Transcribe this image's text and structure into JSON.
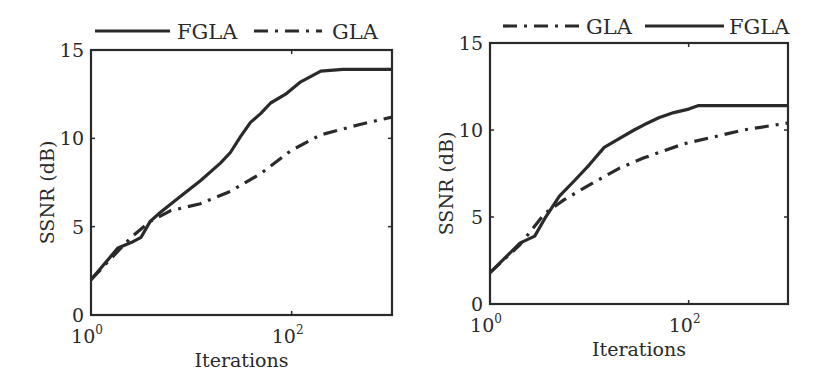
{
  "chart_data": [
    {
      "type": "line",
      "title": "",
      "xlabel": "Iterations",
      "ylabel": "SSNR (dB)",
      "xscale": "log",
      "xlim": [
        1,
        1000
      ],
      "ylim": [
        0,
        15
      ],
      "xticks": [
        {
          "base": "10",
          "exp": "0",
          "value": 1
        },
        {
          "base": "10",
          "exp": "2",
          "value": 100
        }
      ],
      "yticks": [
        0,
        5,
        10,
        15
      ],
      "grid": false,
      "legend_position": "top, outside, horizontal",
      "legend": [
        "FGLA",
        "GLA"
      ],
      "series": [
        {
          "name": "FGLA",
          "style": "solid",
          "x": [
            1,
            1.86,
            2.51,
            3.16,
            3.89,
            4.9,
            7.76,
            12.3,
            19.5,
            24.5,
            30.9,
            38.9,
            49,
            61.7,
            87,
            123,
            195,
            324,
            1000
          ],
          "y": [
            2.0,
            3.8,
            4.1,
            4.4,
            5.3,
            5.8,
            6.7,
            7.6,
            8.6,
            9.2,
            10.1,
            10.9,
            11.4,
            12.0,
            12.5,
            13.2,
            13.8,
            13.9,
            13.9
          ]
        },
        {
          "name": "GLA",
          "style": "dashdot",
          "x": [
            1,
            2.51,
            3.89,
            6.17,
            12.3,
            24.5,
            49,
            98,
            195,
            490,
            1000
          ],
          "y": [
            2.0,
            4.4,
            5.3,
            5.9,
            6.3,
            7.0,
            8.0,
            9.3,
            10.2,
            10.8,
            11.2
          ]
        }
      ]
    },
    {
      "type": "line",
      "title": "",
      "xlabel": "Iterations",
      "ylabel": "SSNR (dB)",
      "xscale": "log",
      "xlim": [
        1,
        1000
      ],
      "ylim": [
        0,
        15
      ],
      "xticks": [
        {
          "base": "10",
          "exp": "0",
          "value": 1
        },
        {
          "base": "10",
          "exp": "2",
          "value": 100
        }
      ],
      "yticks": [
        0,
        5,
        10,
        15
      ],
      "grid": false,
      "legend_position": "top, outside, horizontal",
      "legend": [
        "GLA",
        "FGLA"
      ],
      "series": [
        {
          "name": "GLA",
          "style": "dashdot",
          "x": [
            1,
            2,
            3.55,
            5.6,
            11.2,
            20,
            35.5,
            56,
            89,
            178,
            355,
            1000
          ],
          "y": [
            1.8,
            3.4,
            5.2,
            6.0,
            7.0,
            7.8,
            8.4,
            8.8,
            9.2,
            9.6,
            10.0,
            10.4
          ]
        },
        {
          "name": "FGLA",
          "style": "solid",
          "x": [
            1,
            2,
            2.82,
            3.55,
            5,
            7.1,
            10,
            14.1,
            20,
            28.2,
            35.5,
            50,
            70.8,
            100,
            126,
            1000
          ],
          "y": [
            1.8,
            3.5,
            3.9,
            4.9,
            6.2,
            7.1,
            8.0,
            9.0,
            9.5,
            10.0,
            10.3,
            10.7,
            11.0,
            11.2,
            11.4,
            11.4
          ]
        }
      ]
    }
  ],
  "layout": {
    "panels": [
      {
        "left": 91,
        "top": 50,
        "right": 392,
        "bottom": 315,
        "legend_y": 31,
        "legend_items": [
          {
            "name": "FGLA",
            "style": "solid",
            "line_x1": 95,
            "line_x2": 170,
            "text_x": 177
          },
          {
            "name": "GLA",
            "style": "dashdot",
            "line_x1": 254,
            "line_x2": 322,
            "text_x": 332
          }
        ]
      },
      {
        "left": 490,
        "top": 43,
        "right": 788,
        "bottom": 304,
        "legend_y": 26,
        "legend_items": [
          {
            "name": "GLA",
            "style": "dashdot",
            "line_x1": 503,
            "line_x2": 580,
            "text_x": 586
          },
          {
            "name": "FGLA",
            "style": "solid",
            "line_x1": 645,
            "line_x2": 724,
            "text_x": 729
          }
        ]
      }
    ],
    "line_color": "#2a2a2a"
  }
}
